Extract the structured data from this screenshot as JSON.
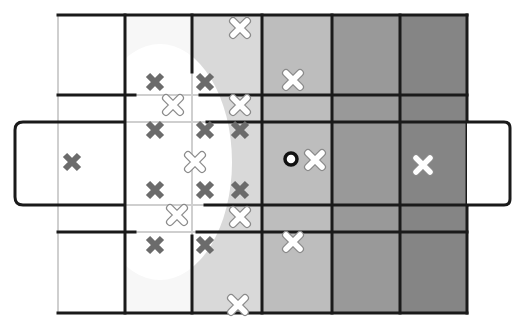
{
  "diagram": {
    "colors": {
      "background": "#ffffff",
      "columns": [
        "#ffffff",
        "#f7f7f7",
        "#d9d9d9",
        "#bdbdbd",
        "#999999",
        "#858585"
      ],
      "line": "#1a1a1a",
      "faint_line": "#cfcfcf",
      "highlight_region": "#ffffff",
      "gray_marker": "#6b6b6b",
      "white_marker_fill": "#ffffff",
      "white_marker_stroke": "#8a8a8a",
      "ball": "#111111"
    },
    "field": {
      "x": 58,
      "y": 15,
      "width": 409,
      "height": 298
    },
    "columns_x": [
      58,
      125,
      192,
      262,
      332,
      400,
      467
    ],
    "rows_y": [
      15,
      95,
      122,
      205,
      232,
      313
    ],
    "left_goal_box": {
      "x": 15,
      "y": 122,
      "width": 110,
      "height": 83
    },
    "right_goal_box": {
      "x": 467,
      "y": 122,
      "width": 43,
      "height": 83
    },
    "highlight_ellipse": {
      "cx": 160,
      "cy": 162,
      "rx": 72,
      "ry": 118
    },
    "gray_markers": [
      {
        "x": 155,
        "y": 82
      },
      {
        "x": 205,
        "y": 82
      },
      {
        "x": 155,
        "y": 130
      },
      {
        "x": 205,
        "y": 130
      },
      {
        "x": 240,
        "y": 130
      },
      {
        "x": 72,
        "y": 162
      },
      {
        "x": 155,
        "y": 190
      },
      {
        "x": 205,
        "y": 190
      },
      {
        "x": 240,
        "y": 190
      },
      {
        "x": 155,
        "y": 245
      },
      {
        "x": 205,
        "y": 245
      }
    ],
    "white_markers": [
      {
        "x": 240,
        "y": 28
      },
      {
        "x": 293,
        "y": 80
      },
      {
        "x": 173,
        "y": 105
      },
      {
        "x": 240,
        "y": 105
      },
      {
        "x": 195,
        "y": 162
      },
      {
        "x": 315,
        "y": 160
      },
      {
        "x": 423,
        "y": 165
      },
      {
        "x": 177,
        "y": 215
      },
      {
        "x": 240,
        "y": 217
      },
      {
        "x": 293,
        "y": 242
      },
      {
        "x": 238,
        "y": 305
      }
    ],
    "ball": {
      "x": 291,
      "y": 159,
      "r": 6
    }
  }
}
